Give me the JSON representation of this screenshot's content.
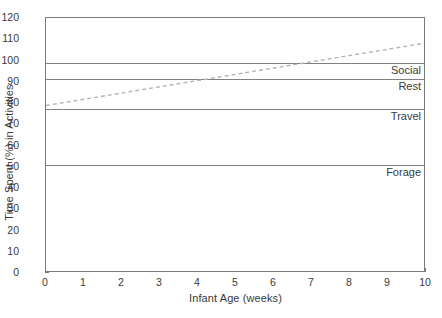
{
  "chart_data": {
    "type": "line",
    "title": "",
    "xlabel": "Infant Age (weeks)",
    "ylabel": "Time Spent (%) in Activities",
    "xlim": [
      0,
      10
    ],
    "ylim": [
      0,
      120
    ],
    "xticks": [
      0,
      1,
      2,
      3,
      4,
      5,
      6,
      7,
      8,
      9,
      10
    ],
    "yticks": [
      0,
      10,
      20,
      30,
      40,
      50,
      60,
      70,
      80,
      90,
      100,
      110,
      120
    ],
    "grid": false,
    "legend_position": "inline-right",
    "boundary_lines": [
      {
        "label": "Social",
        "value": 99,
        "style": "solid",
        "color": "#808080"
      },
      {
        "label": "Rest",
        "value": 91.5,
        "style": "solid",
        "color": "#808080"
      },
      {
        "label": "Travel",
        "value": 77,
        "style": "solid",
        "color": "#808080"
      },
      {
        "label": "Forage",
        "value": 51,
        "style": "solid",
        "color": "#808080"
      }
    ],
    "series": [
      {
        "name": "trend",
        "style": "dashed",
        "color": "#b4b4b4",
        "x": [
          0,
          10
        ],
        "values": [
          78.5,
          108
        ]
      }
    ]
  }
}
